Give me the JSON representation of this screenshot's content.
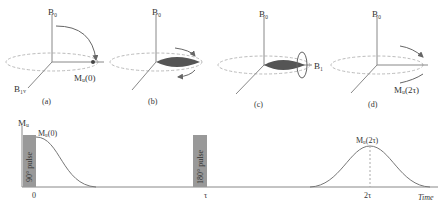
{
  "panels": [
    {
      "caption": "(a)",
      "axis_label": "B₀",
      "vector_label": "Mᵤ(0)",
      "extra_label": "B₁ᵥ"
    },
    {
      "caption": "(b)",
      "axis_label": "B₀"
    },
    {
      "caption": "(c)",
      "axis_label": "B₀",
      "vector_label": "B₁"
    },
    {
      "caption": "(d)",
      "axis_label": "B₀",
      "vector_label": "Mᵤ(2τ)"
    }
  ],
  "timeline": {
    "y_axis_label": "Mᵤ",
    "start_label": "Mᵤ(0)",
    "echo_label": "Mᵤ(2τ)",
    "pulse1_label": "90° pulse",
    "pulse2_label": "180° pulse",
    "tick_0": "0",
    "tick_tau": "τ",
    "tick_2tau": "2τ",
    "x_axis_label": "Time"
  }
}
